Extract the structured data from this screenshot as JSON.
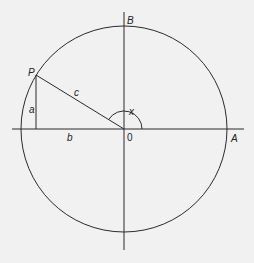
{
  "figure": {
    "type": "unit-circle trigonometry diagram",
    "labels": {
      "P": "P",
      "A": "A",
      "B": "B",
      "origin": "0",
      "a": "a",
      "b": "b",
      "c": "c",
      "x": "x"
    },
    "colors": {
      "background": "#f1f1f1",
      "line": "#2a2a2a"
    }
  }
}
